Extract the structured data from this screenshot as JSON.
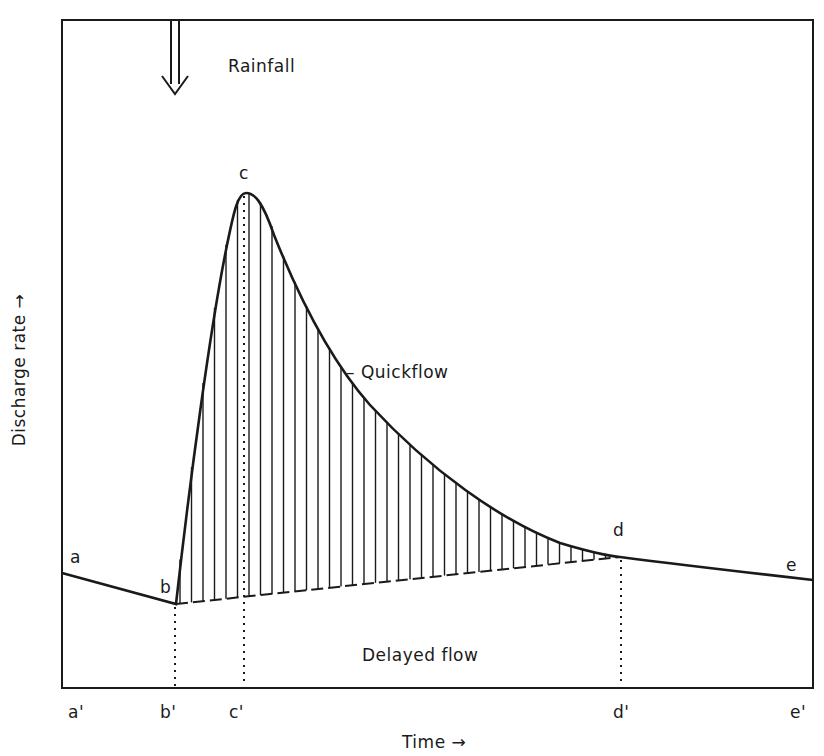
{
  "diagram": {
    "type": "hydrograph",
    "y_axis_label": "Discharge rate →",
    "x_axis_label": "Time →",
    "annotations": {
      "rainfall": "Rainfall",
      "quickflow": "– Quickflow",
      "delayed_flow": "Delayed flow"
    },
    "curve_points": {
      "a": "a",
      "b": "b",
      "c": "c",
      "d": "d",
      "e": "e"
    },
    "time_ticks": {
      "a_prime": "a'",
      "b_prime": "b'",
      "c_prime": "c'",
      "d_prime": "d'",
      "e_prime": "e'"
    }
  },
  "chart_data": {
    "type": "line",
    "title": "",
    "xlabel": "Time →",
    "ylabel": "Discharge rate →",
    "series": [
      {
        "name": "Hydrograph (total flow)",
        "points": [
          [
            "a'",
            "a"
          ],
          [
            "b'",
            "b"
          ],
          [
            "c'",
            "c (peak)"
          ],
          [
            "d'",
            "d"
          ],
          [
            "e'",
            "e"
          ]
        ]
      },
      {
        "name": "Baseflow separation line",
        "points": [
          [
            "b'",
            "b"
          ],
          [
            "d'",
            "d"
          ]
        ]
      }
    ],
    "regions": [
      "Quickflow (hatched, above separation line b–d)",
      "Delayed flow (below)"
    ],
    "annotations": [
      "Rainfall arrow at b'"
    ]
  }
}
